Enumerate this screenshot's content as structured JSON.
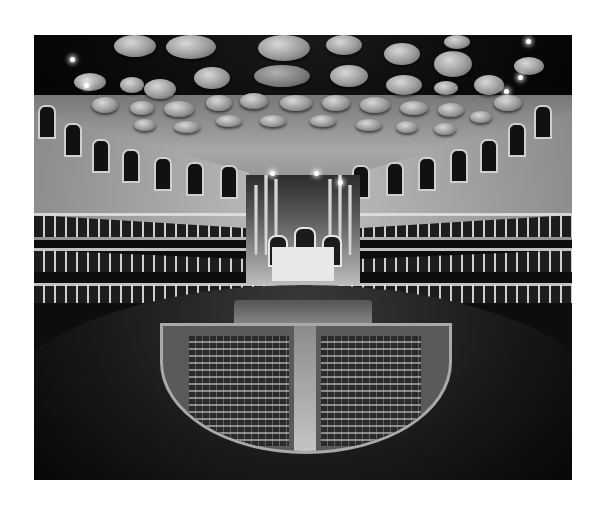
{
  "photo": {
    "subject": "Concert hall interior",
    "style": "black-and-white",
    "elements": [
      "acoustic-diffuser-discs",
      "arched-upper-gallery",
      "tiered-balconies",
      "pipe-organ",
      "stage",
      "arena-stalls",
      "center-aisle"
    ]
  },
  "colors": {
    "border": "#ffffff",
    "dark": "#0d0d0d",
    "highlight": "#e3e3e3"
  }
}
